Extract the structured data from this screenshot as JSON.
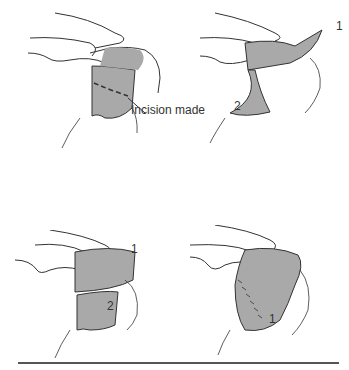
{
  "figure": {
    "panels": [
      {
        "id": "a",
        "label": "Incision made",
        "description": "Shoulder with shaded skin region and dashed incision line"
      },
      {
        "id": "b",
        "labels": [
          "1",
          "2"
        ],
        "description": "Flap 1 raised upward, flap 2 reflected downward"
      },
      {
        "id": "c",
        "labels": [
          "1",
          "2"
        ],
        "description": "Flap 1 raised, flap 2 repositioned over defect"
      },
      {
        "id": "d",
        "labels": [
          "1"
        ],
        "description": "Flaps sutured in place with stitch line"
      }
    ],
    "colors": {
      "line": "#333333",
      "shade": "#a9a9a9",
      "rule": "#555555"
    }
  }
}
